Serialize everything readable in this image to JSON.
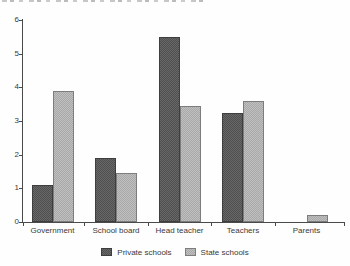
{
  "chart_data": {
    "type": "bar",
    "title": "",
    "xlabel": "",
    "ylabel": "",
    "categories": [
      "Government",
      "School board",
      "Head teacher",
      "Teachers",
      "Parents"
    ],
    "series": [
      {
        "name": "Private schools",
        "color": "#5c5c5c",
        "values": [
          1.1,
          1.9,
          5.5,
          3.25,
          0
        ]
      },
      {
        "name": "State schools",
        "color": "#b3b3b3",
        "values": [
          3.9,
          1.45,
          3.45,
          3.6,
          0.2
        ]
      }
    ],
    "ylim": [
      0,
      6
    ],
    "yticks": [
      0,
      1,
      2,
      3,
      4,
      5,
      6
    ],
    "grid": false,
    "legend_position": "bottom"
  }
}
